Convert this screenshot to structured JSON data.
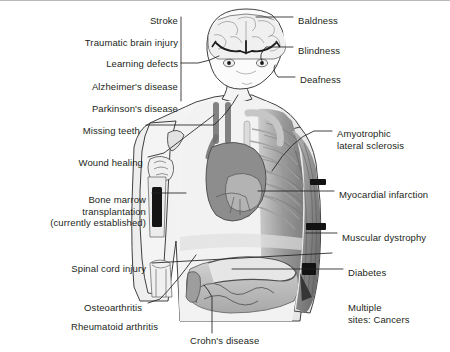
{
  "figure": {
    "background_color": "#ffffff",
    "text_color": "#231f20",
    "line_color": "#231f20",
    "body_fill": "#f2f2f2",
    "organ_gray": "#9a9a9a",
    "marker_color": "#111111"
  },
  "labels_left": [
    {
      "id": "stroke",
      "text": "Stroke",
      "x": 178,
      "y": 14,
      "align": "right"
    },
    {
      "id": "traumatic-brain-injury",
      "text": "Traumatic brain injury",
      "x": 178,
      "y": 36,
      "align": "right"
    },
    {
      "id": "learning-defects",
      "text": "Learning defects",
      "x": 178,
      "y": 57,
      "align": "right"
    },
    {
      "id": "alzheimers-disease",
      "text": "Alzheimer's disease",
      "x": 178,
      "y": 80,
      "align": "right"
    },
    {
      "id": "parkinsons-disease",
      "text": "Parkinson's disease",
      "x": 178,
      "y": 102,
      "align": "right"
    },
    {
      "id": "missing-teeth",
      "text": "Missing teeth",
      "x": 140,
      "y": 124,
      "align": "right"
    },
    {
      "id": "wound-healing",
      "text": "Wound healing",
      "x": 143,
      "y": 156,
      "align": "right"
    },
    {
      "id": "bone-marrow-transplantation",
      "text": "Bone marrow\ntransplantation\n(currently established)",
      "x": 146,
      "y": 193,
      "align": "right"
    },
    {
      "id": "spinal-cord-injury",
      "text": "Spinal cord injury",
      "x": 146,
      "y": 262,
      "align": "right"
    },
    {
      "id": "osteoarthritis",
      "text": "Osteoarthritis",
      "x": 142,
      "y": 301,
      "align": "right"
    },
    {
      "id": "rheumatoid-arthritis",
      "text": "Rheumatoid arthritis",
      "x": 158,
      "y": 320,
      "align": "right"
    }
  ],
  "labels_right": [
    {
      "id": "baldness",
      "text": "Baldness",
      "x": 298,
      "y": 14,
      "align": "left"
    },
    {
      "id": "blindness",
      "text": "Blindness",
      "x": 298,
      "y": 44,
      "align": "left"
    },
    {
      "id": "deafness",
      "text": "Deafness",
      "x": 300,
      "y": 73,
      "align": "left"
    },
    {
      "id": "amyotrophic-lateral-sclerosis",
      "text": "Amyotrophic\nlateral sclerosis",
      "x": 337,
      "y": 127,
      "align": "left"
    },
    {
      "id": "myocardial-infarction",
      "text": "Myocardial infarction",
      "x": 339,
      "y": 188,
      "align": "left"
    },
    {
      "id": "muscular-dystrophy",
      "text": "Muscular dystrophy",
      "x": 342,
      "y": 231,
      "align": "left"
    },
    {
      "id": "diabetes",
      "text": "Diabetes",
      "x": 348,
      "y": 266,
      "align": "left"
    },
    {
      "id": "multiple-sites-cancers",
      "text": "Multiple\nsites: Cancers",
      "x": 348,
      "y": 301,
      "align": "left"
    }
  ],
  "labels_bottom": [
    {
      "id": "crohns-disease",
      "text": "Crohn's disease",
      "x": 190,
      "y": 334,
      "align": "left"
    }
  ],
  "anatomy_parts": [
    "brain",
    "eyes",
    "head",
    "neck",
    "shoulders",
    "ribcage",
    "heart",
    "lungs-vessels",
    "left-arm",
    "right-arm",
    "humerus-bone-marrow",
    "elbow-joint",
    "intestines",
    "torso",
    "hips"
  ]
}
